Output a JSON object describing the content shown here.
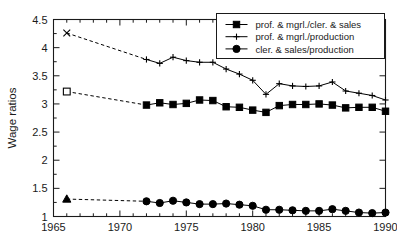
{
  "chart_data": {
    "type": "line",
    "title": "",
    "xlabel": "",
    "ylabel": "Wage ratios",
    "xlim": [
      1965,
      1990
    ],
    "ylim": [
      1.0,
      4.5
    ],
    "grid": false,
    "legend_position": "top-right",
    "x_ticks": [
      "1965",
      "1970",
      "1975",
      "1980",
      "1985",
      "1990"
    ],
    "x_tick_values": [
      1965,
      1970,
      1975,
      1980,
      1985,
      1990
    ],
    "x_minor_tick_step": 1,
    "y_ticks": [
      "1",
      "1.5",
      "2",
      "2.5",
      "3",
      "3.5",
      "4",
      "4.5"
    ],
    "y_tick_values": [
      1,
      1.5,
      2,
      2.5,
      3,
      3.5,
      4,
      4.5
    ],
    "series": [
      {
        "name": "prof. & mgrl./cler. & sales",
        "marker": "square-filled",
        "first_point_marker": "square-open",
        "color": "#000000",
        "x": [
          1966,
          1972,
          1973,
          1974,
          1975,
          1976,
          1977,
          1978,
          1979,
          1980,
          1981,
          1982,
          1983,
          1984,
          1985,
          1986,
          1987,
          1988,
          1989,
          1990
        ],
        "values": [
          3.22,
          2.98,
          3.02,
          2.99,
          3.01,
          3.07,
          3.06,
          2.95,
          2.94,
          2.89,
          2.85,
          2.97,
          2.99,
          2.99,
          3.0,
          2.98,
          2.93,
          2.94,
          2.94,
          2.87
        ],
        "gap_after_first_point": true
      },
      {
        "name": "prof. & mgrl./production",
        "marker": "plus",
        "first_point_marker": "x-cross",
        "color": "#000000",
        "x": [
          1966,
          1972,
          1973,
          1974,
          1975,
          1976,
          1977,
          1978,
          1979,
          1980,
          1981,
          1982,
          1983,
          1984,
          1985,
          1986,
          1987,
          1988,
          1989,
          1990
        ],
        "values": [
          4.26,
          3.79,
          3.72,
          3.83,
          3.77,
          3.74,
          3.74,
          3.62,
          3.53,
          3.42,
          3.17,
          3.36,
          3.32,
          3.31,
          3.32,
          3.39,
          3.23,
          3.19,
          3.15,
          3.07
        ],
        "gap_after_first_point": true
      },
      {
        "name": "cler. & sales/production",
        "marker": "circle-filled",
        "first_point_marker": "triangle-filled",
        "color": "#000000",
        "x": [
          1966,
          1972,
          1973,
          1974,
          1975,
          1976,
          1977,
          1978,
          1979,
          1980,
          1981,
          1982,
          1983,
          1984,
          1985,
          1986,
          1987,
          1988,
          1989,
          1990
        ],
        "values": [
          1.31,
          1.27,
          1.24,
          1.28,
          1.25,
          1.22,
          1.22,
          1.23,
          1.21,
          1.19,
          1.12,
          1.12,
          1.11,
          1.1,
          1.1,
          1.13,
          1.1,
          1.07,
          1.06,
          1.07
        ],
        "gap_after_first_point": true
      }
    ]
  },
  "legend": {
    "entries": [
      {
        "label": "prof. & mgrl./cler. & sales"
      },
      {
        "label": "prof. & mgrl./production"
      },
      {
        "label": "cler. & sales/production"
      }
    ]
  },
  "axes": {
    "y_title": "Wage ratios"
  }
}
